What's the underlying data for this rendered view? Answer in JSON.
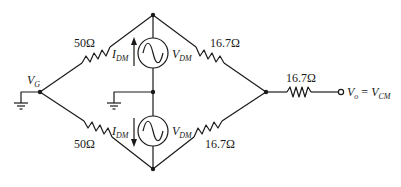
{
  "diagram": {
    "type": "circuit-schematic",
    "nodes": {
      "vg": {
        "label": "V",
        "sub": "G"
      },
      "output": {
        "label_lhs": "V",
        "lhs_sub": "o",
        "eq": " = ",
        "label_rhs": "V",
        "rhs_sub": "CM"
      }
    },
    "resistors": {
      "upper_left": "50Ω",
      "lower_left": "50Ω",
      "upper_right": "16.7Ω",
      "lower_right": "16.7Ω",
      "output": "16.7Ω"
    },
    "sources": {
      "top": {
        "current": "I",
        "current_sub": "DM",
        "voltage": "V",
        "voltage_sub": "DM",
        "current_direction": "up"
      },
      "bottom": {
        "current": "I",
        "current_sub": "DM",
        "voltage": "V",
        "voltage_sub": "DM",
        "current_direction": "down"
      }
    },
    "colors": {
      "stroke": "#1a1a1a",
      "background": "#ffffff"
    }
  }
}
